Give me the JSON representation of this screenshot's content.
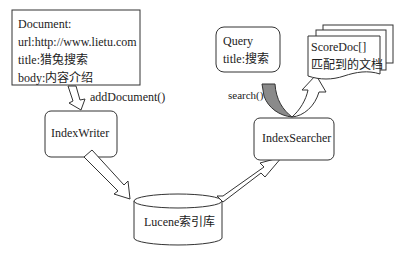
{
  "document_box": {
    "lines": [
      "Document:",
      "url:http://www.lietu.com",
      "title:猎兔搜索",
      "body:内容介绍"
    ]
  },
  "add_document_label": "addDocument()",
  "index_writer": {
    "label": "IndexWriter"
  },
  "lucene_index": {
    "label": "Lucene索引库"
  },
  "index_searcher": {
    "label": "IndexSearcher"
  },
  "query_box": {
    "lines": [
      "Query",
      "title:搜索"
    ]
  },
  "search_label": "search()",
  "score_docs": {
    "lines": [
      "ScoreDoc[]",
      "匹配到的文档"
    ]
  },
  "colors": {
    "stroke": "#333333",
    "search_arrow_fill": "#8a8a8a",
    "background": "#ffffff"
  }
}
